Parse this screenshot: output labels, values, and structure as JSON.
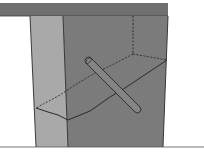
{
  "diagram": {
    "title": "",
    "colors": {
      "background": "#ffffff",
      "top_band": "#6f6f6f",
      "left_face": "#a9a9a9",
      "front_face": "#7b7b7b",
      "line": "#2a2a2a",
      "rod_fill": "#858585"
    },
    "elements": [
      {
        "id": "top-band",
        "label": ""
      },
      {
        "id": "left-face",
        "label": ""
      },
      {
        "id": "front-face",
        "label": ""
      },
      {
        "id": "fracture-plane",
        "label": ""
      },
      {
        "id": "hidden-edges",
        "label": ""
      },
      {
        "id": "rod",
        "label": ""
      }
    ]
  }
}
